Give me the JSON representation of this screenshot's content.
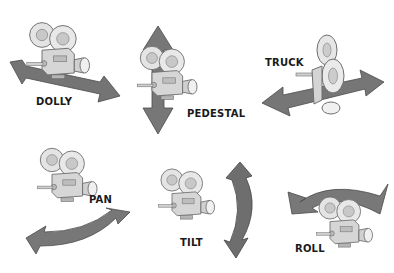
{
  "colors": {
    "arrow_fill": "#7a7a7a",
    "arrow_dark": "#555555",
    "camera_body": "#d8d8d8",
    "camera_outline": "#6e6e6e",
    "reel": "#e6e6e6",
    "label": "#1a1a1a",
    "background": "#ffffff"
  },
  "panels": [
    {
      "id": "dolly",
      "label": "DOLLY",
      "icon": "camera-with-diagonal-double-arrow"
    },
    {
      "id": "pedestal",
      "label": "PEDESTAL",
      "icon": "camera-with-vertical-double-arrow"
    },
    {
      "id": "truck",
      "label": "TRUCK",
      "icon": "camera-with-horizontal-double-arrow"
    },
    {
      "id": "pan",
      "label": "PAN",
      "icon": "camera-with-curved-horizontal-arrow"
    },
    {
      "id": "tilt",
      "label": "TILT",
      "icon": "camera-with-curved-vertical-double-arrow"
    },
    {
      "id": "roll",
      "label": "ROLL",
      "icon": "camera-with-curved-over-arrow"
    }
  ]
}
